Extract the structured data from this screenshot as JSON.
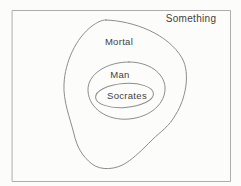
{
  "diagram": {
    "type": "euler-diagram",
    "sets": [
      {
        "label": "Something",
        "shape": "rectangle",
        "contains": "Mortal"
      },
      {
        "label": "Mortal",
        "shape": "irregular-blob",
        "contains": "Man"
      },
      {
        "label": "Man",
        "shape": "oval",
        "contains": "Socrates"
      },
      {
        "label": "Socrates",
        "shape": "ellipse",
        "contains": ""
      }
    ],
    "colors": {
      "background": "#fcfcfa",
      "frame": "#adadad",
      "outline": "#8d8d8d",
      "text": "#424242"
    }
  }
}
